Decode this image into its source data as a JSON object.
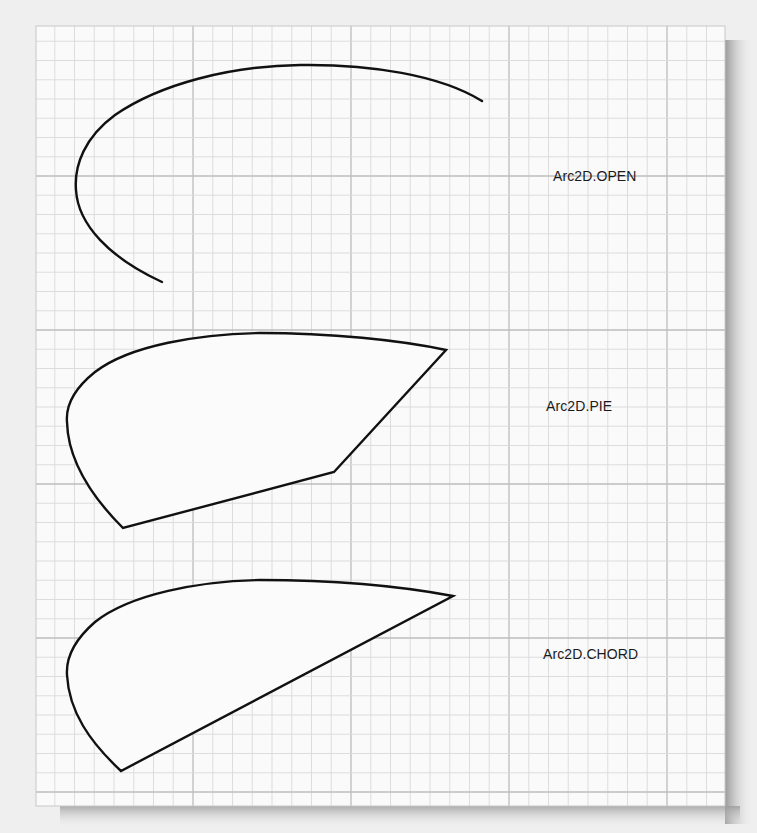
{
  "figure": {
    "background_color": "#efefef",
    "paper_color": "#fafafa",
    "grid_minor_color": "#d9d9d9",
    "grid_major_color": "#bdbdbd",
    "stroke_color": "#111111",
    "shape_fill_color": "#fbfbfb"
  },
  "arcs": [
    {
      "type": "OPEN",
      "label": "Arc2D.OPEN",
      "filled": false
    },
    {
      "type": "PIE",
      "label": "Arc2D.PIE",
      "filled": true
    },
    {
      "type": "CHORD",
      "label": "Arc2D.CHORD",
      "filled": true
    }
  ]
}
